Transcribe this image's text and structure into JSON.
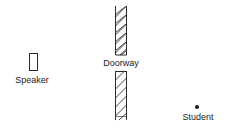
{
  "diagram": {
    "speaker": {
      "label": "Speaker",
      "box": {
        "x": 29,
        "y": 53,
        "width": 8,
        "height": 17
      },
      "label_pos": {
        "x": 32,
        "y": 75
      }
    },
    "doorway": {
      "label": "Doorway",
      "label_pos": {
        "x": 121,
        "y": 59
      },
      "upper_wall": {
        "x": 115,
        "y": 6,
        "width": 11,
        "height": 49
      },
      "lower_wall": {
        "x": 115,
        "y": 71,
        "width": 11,
        "height": 45,
        "line_extend_to": 120
      }
    },
    "student": {
      "label": "Student",
      "dot": {
        "cx": 197,
        "cy": 107,
        "r": 2
      },
      "label_pos": {
        "x": 198,
        "y": 112
      }
    },
    "colors": {
      "stroke": "#2a2a2a",
      "background": "#ffffff"
    }
  }
}
